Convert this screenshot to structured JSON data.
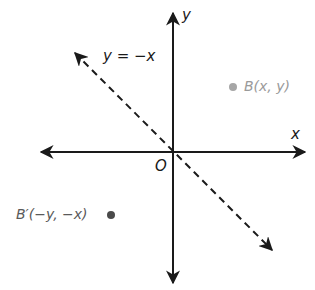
{
  "diagram": {
    "axes": {
      "x_label": "x",
      "y_label": "y",
      "origin_label": "O"
    },
    "line": {
      "label": "y = −x",
      "style": "dashed"
    },
    "points": [
      {
        "id": "B",
        "label": "B(x, y)",
        "color": "#a6a6a6"
      },
      {
        "id": "B_prime",
        "label": "B′(−y, −x)",
        "color": "#4a4a4a"
      }
    ],
    "colors": {
      "axis": "#1a1a1a",
      "line": "#1a1a1a"
    }
  }
}
